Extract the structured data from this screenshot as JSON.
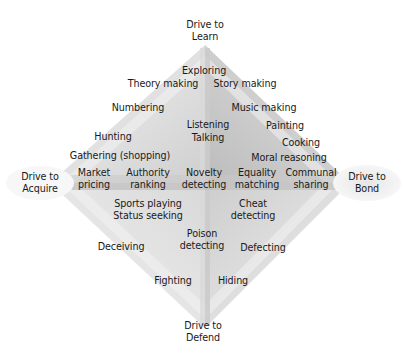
{
  "diagram": {
    "type": "diamond-drive-map",
    "poles": {
      "top": {
        "line1": "Drive to",
        "line2": "Learn"
      },
      "left": {
        "line1": "Drive to",
        "line2": "Acquire"
      },
      "right": {
        "line1": "Drive to",
        "line2": "Bond"
      },
      "bottom": {
        "line1": "Drive to",
        "line2": "Defend"
      }
    },
    "labels": {
      "exploring": "Exploring",
      "theory_making": "Theory making",
      "story_making": "Story making",
      "numbering": "Numbering",
      "music_making": "Music making",
      "listening": "Listening",
      "talking": "Talking",
      "painting": "Painting",
      "hunting": "Hunting",
      "cooking": "Cooking",
      "gathering": "Gathering (shopping)",
      "moral_reasoning": "Moral reasoning",
      "market_1": "Market",
      "market_2": "pricing",
      "authority_1": "Authority",
      "authority_2": "ranking",
      "novelty_1": "Novelty",
      "novelty_2": "detecting",
      "equality_1": "Equality",
      "equality_2": "matching",
      "communal_1": "Communal",
      "communal_2": "sharing",
      "sports_playing": "Sports playing",
      "status_seeking": "Status seeking",
      "cheat_1": "Cheat",
      "cheat_2": "detecting",
      "poison_1": "Poison",
      "poison_2": "detecting",
      "deceiving": "Deceiving",
      "defecting": "Defecting",
      "fighting": "Fighting",
      "hiding": "Hiding"
    },
    "colors": {
      "shade_light": "#ececec",
      "shade_mid": "#d6d6d6",
      "shade_dark": "#bdbdbd",
      "text": "#1a1a1a"
    }
  }
}
